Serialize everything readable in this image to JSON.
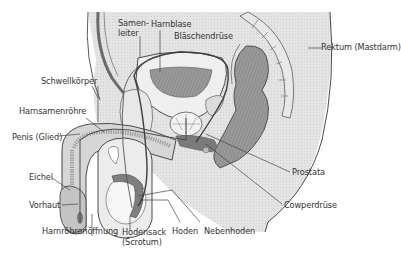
{
  "diagram": {
    "type": "anatomical-sagittal-section",
    "colors": {
      "background": "#ffffff",
      "tissue_light": "#e6e6e6",
      "tissue_mid": "#c8c8c8",
      "tissue_dark": "#8c8c8c",
      "organ_dark": "#7a7a7a",
      "outline": "#4a4a4a",
      "leader_line": "#444444",
      "label_text": "#333333"
    },
    "labels": [
      {
        "id": "samenleiter",
        "text_line1": "Samen-",
        "text_line2": "leiter"
      },
      {
        "id": "harnblase",
        "text": "Harnblase"
      },
      {
        "id": "blaeschendruese",
        "text": "Bläschendrüse"
      },
      {
        "id": "rektum",
        "text": "Rektum (Mastdarm)"
      },
      {
        "id": "schwellkoerper",
        "text": "Schwellkörper"
      },
      {
        "id": "harnsamenroehre",
        "text": "Harnsamenröhre"
      },
      {
        "id": "penis",
        "text": "Penis (Glied)"
      },
      {
        "id": "eichel",
        "text": "Eichel"
      },
      {
        "id": "vorhaut",
        "text": "Vorhaut"
      },
      {
        "id": "harnroehrenoeffnung",
        "text": "Harnröhrenöffnung"
      },
      {
        "id": "hodensack",
        "text_line1": "Hodensack",
        "text_line2": "(Scrotum)"
      },
      {
        "id": "hoden",
        "text": "Hoden"
      },
      {
        "id": "nebenhoden",
        "text": "Nebenhoden"
      },
      {
        "id": "prostata",
        "text": "Prostata"
      },
      {
        "id": "cowperdruese",
        "text": "Cowperdrüse"
      }
    ]
  }
}
